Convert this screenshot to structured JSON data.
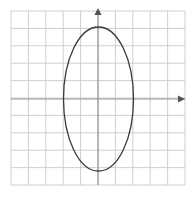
{
  "figure": {
    "background_color": "#ffffff",
    "width": 194,
    "height": 197
  },
  "grid": {
    "label": "square grid",
    "columns": 10,
    "rows": 10,
    "cell_size": 17.4,
    "left": 11,
    "top": 11,
    "right": 185,
    "bottom": 185,
    "line_color": "#c9c9c9",
    "line_width": 0.9,
    "border_color": "#c9c9c9"
  },
  "axes": {
    "label": "coordinate axes",
    "origin_x": 98,
    "origin_y": 99,
    "color": "#8f8f8f",
    "line_width": 1.1,
    "x_axis": {
      "label": "x-axis",
      "from_x": 11,
      "to_x": 185,
      "y": 99,
      "arrow": "right"
    },
    "y_axis": {
      "label": "y-axis",
      "x": 98,
      "from_y": 185,
      "to_y": 11,
      "arrow": "up"
    },
    "arrow_color": "#555555"
  },
  "chart_data": {
    "type": "scatter",
    "xlabel": "",
    "ylabel": "",
    "grid": true,
    "legend": "none",
    "xlim": [
      -5,
      5
    ],
    "ylim": [
      -5,
      5
    ],
    "xticks": [
      -5,
      -4,
      -3,
      -2,
      -1,
      0,
      1,
      2,
      3,
      4,
      5
    ],
    "yticks": [
      -5,
      -4,
      -3,
      -2,
      -1,
      0,
      1,
      2,
      3,
      4,
      5
    ],
    "shapes": [
      {
        "kind": "ellipse",
        "name": "ellipse-curve",
        "center": [
          0,
          0
        ],
        "semi_axis_x": 2,
        "semi_axis_y": 4,
        "orientation": "vertical",
        "equation": "x^2/4 + y^2/16 = 1",
        "stroke": "#3a3a3a",
        "stroke_width": 1.3,
        "fill": "none",
        "pixel_center": [
          98.5,
          99
        ],
        "pixel_rx": 35,
        "pixel_ry": 72
      }
    ]
  }
}
